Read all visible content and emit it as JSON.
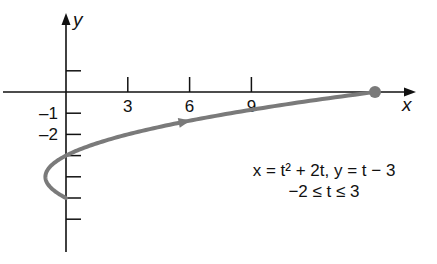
{
  "chart_data": {
    "type": "line",
    "title": "",
    "xlabel": "x",
    "ylabel": "y",
    "x_ticks": [
      3,
      6,
      9
    ],
    "x_tick_labels": [
      "3",
      "6",
      "9"
    ],
    "y_ticks": [
      1,
      -1,
      -2,
      -3,
      -4,
      -5,
      -6
    ],
    "y_tick_labels": [
      "-1",
      "-2"
    ],
    "xlim": [
      -3,
      17
    ],
    "ylim": [
      -8,
      3.5
    ],
    "grid": false,
    "legend": "none",
    "annotations": {
      "equation_line1": "x = t² + 2t,  y = t − 3",
      "equation_line2": "−2 ≤ t ≤ 3"
    },
    "series": [
      {
        "name": "parametric curve",
        "parameter": "t",
        "t_range": [
          -2,
          3
        ],
        "x": [
          0,
          -0.75,
          -1,
          -0.75,
          0,
          1.25,
          3,
          5.25,
          8,
          11.25,
          15
        ],
        "y": [
          -5,
          -4.5,
          -4,
          -3.5,
          -3,
          -2.5,
          -2,
          -1.5,
          -1,
          -0.5,
          0
        ],
        "t": [
          -2,
          -1.5,
          -1,
          -0.5,
          0,
          0.5,
          1,
          1.5,
          2,
          2.5,
          3
        ],
        "direction_arrow": "increasing t",
        "endpoint_marker": {
          "x": 15,
          "y": 0
        }
      }
    ],
    "colors": {
      "curve": "#7a7a7a",
      "axes": "#111111",
      "marker": "#7a7a7a"
    }
  }
}
